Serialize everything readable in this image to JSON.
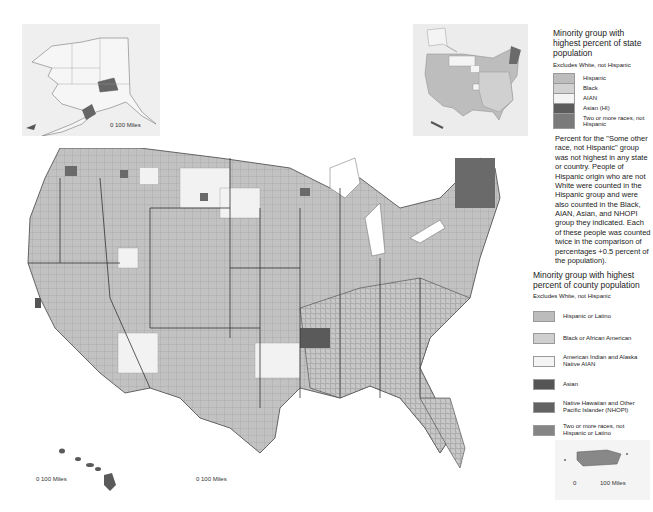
{
  "map": {
    "title": "Minority group with highest percent of county population",
    "colors": {
      "hispanic": "#bcbcbc",
      "black": "#cfcfcf",
      "aian": "#f4f4f4",
      "asian": "#5a5a5a",
      "nhopi": "#6e6e6e",
      "two_or_more": "#8a8a8a",
      "border": "#555555",
      "background": "#ffffff"
    }
  },
  "state_legend": {
    "title": "Minority group with highest percent of state population",
    "subtitle": "Excludes White, not Hispanic",
    "items": [
      {
        "label": "Hispanic",
        "color": "#bdbdbd"
      },
      {
        "label": "Black",
        "color": "#d2d2d2"
      },
      {
        "label": "AIAN",
        "color": "#f4f4f4"
      },
      {
        "label": "Asian (HI)",
        "color": "#5c5c5c"
      },
      {
        "label": "Two or more races, not Hispanic",
        "color": "#7a7a7a"
      }
    ]
  },
  "note": "Percent for the \"Some other race, not Hispanic\" group was not highest in any state or country. People of Hispanic origin who are not White were counted in the Hispanic group and were also counted in the Black, AIAN, Asian, and NHOPI group they indicated. Each of these people was counted twice in the comparison of percentages +0.5 percent of the population).",
  "county_legend": {
    "title": "Minority group with highest percent of county population",
    "subtitle": "Excludes White, not Hispanic",
    "items": [
      {
        "label": "Hispanic or Latino",
        "color": "#bcbcbc"
      },
      {
        "label": "Black or African American",
        "color": "#cfcfcf"
      },
      {
        "label": "American Indian and Alaska Native AIAN",
        "color": "#f4f4f4"
      },
      {
        "label": "Asian",
        "color": "#555555"
      },
      {
        "label": "Native Hawaiian and Other Pacific Islander (NHOPI)",
        "color": "#626262"
      },
      {
        "label": "Two or more races, not Hispanic or Latino",
        "color": "#858585"
      }
    ]
  },
  "scales": {
    "alaska": "0  100 Miles",
    "hawaii": "0  100 Miles",
    "conus": "0  100 Miles",
    "puerto_rico_zero": "0",
    "puerto_rico": "100 Miles"
  }
}
